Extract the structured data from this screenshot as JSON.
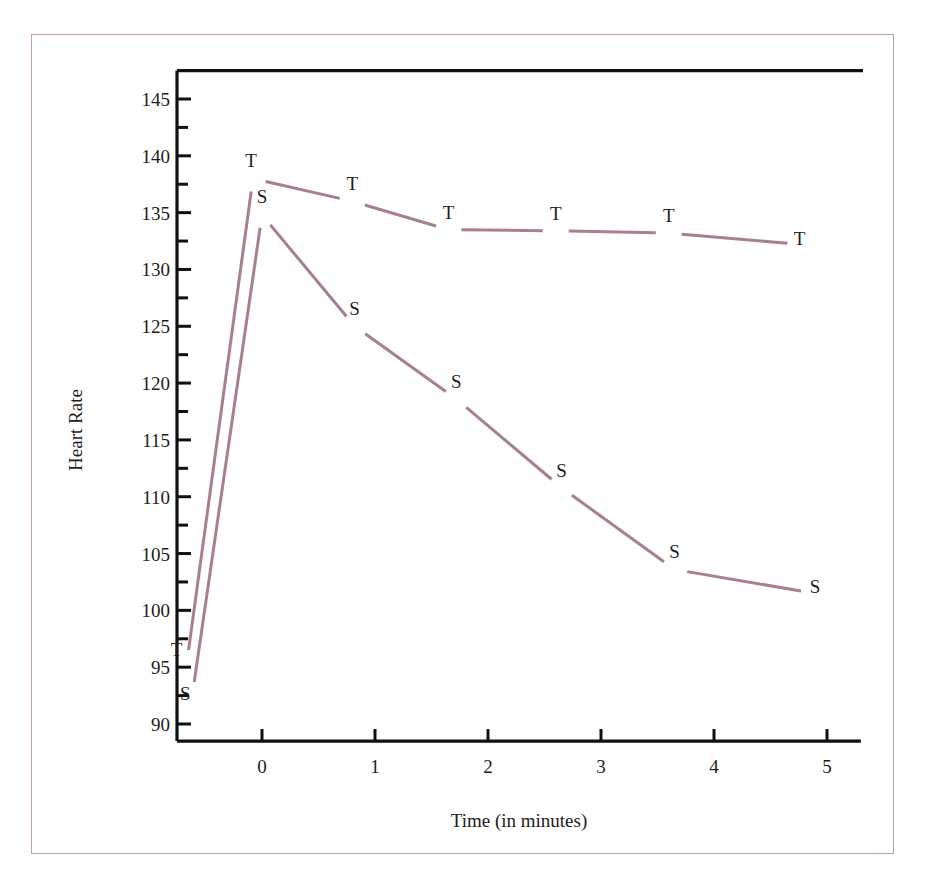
{
  "figure": {
    "frame_color": "#c0a0a8",
    "background": "#ffffff"
  },
  "chart_data": {
    "type": "line",
    "title": "",
    "subtitle": "",
    "xlabel": "Time (in minutes)",
    "ylabel": "Heart Rate",
    "xlim": [
      -0.85,
      5.3
    ],
    "ylim": [
      88.5,
      147.5
    ],
    "xticks": [
      0,
      1,
      2,
      3,
      4,
      5
    ],
    "xtick_labels": [
      "0",
      "1",
      "2",
      "3",
      "4",
      "5"
    ],
    "yticks": [
      90,
      95,
      100,
      105,
      110,
      115,
      120,
      125,
      130,
      135,
      140,
      145
    ],
    "ytick_labels": [
      "90",
      "95",
      "100",
      "105",
      "110",
      "115",
      "120",
      "125",
      "130",
      "135",
      "140",
      "145"
    ],
    "yminor_ticks": [
      92.5,
      97.5,
      102.5,
      107.5,
      112.5,
      117.5,
      122.5,
      127.5,
      132.5,
      137.5,
      142.5
    ],
    "grid": false,
    "legend": "none",
    "point_marker": "letter",
    "line_color": "#a6808c",
    "line_width": 3,
    "series": [
      {
        "name": "T",
        "label_letter": "T",
        "color": "#a6808c",
        "x": [
          -0.65,
          -0.08,
          0.8,
          1.65,
          2.6,
          3.6,
          4.65
        ],
        "values": [
          96.5,
          138.0,
          136.0,
          133.5,
          133.4,
          133.2,
          132.3
        ],
        "label_offsets": [
          {
            "dx": -12,
            "dy": 6
          },
          {
            "dx": -2,
            "dy": -12
          },
          {
            "dx": 0,
            "dy": -11
          },
          {
            "dx": 0,
            "dy": -11
          },
          {
            "dx": 0,
            "dy": -11
          },
          {
            "dx": 0,
            "dy": -11
          },
          {
            "dx": 12,
            "dy": 2
          }
        ]
      },
      {
        "name": "S",
        "label_letter": "S",
        "color": "#a6808c",
        "x": [
          -0.6,
          0.0,
          0.82,
          1.72,
          2.65,
          3.65,
          4.77
        ],
        "values": [
          93.7,
          134.8,
          125.0,
          118.6,
          110.8,
          103.6,
          101.7
        ],
        "label_offsets": [
          {
            "dx": -9,
            "dy": 18
          },
          {
            "dx": 0,
            "dy": -12
          },
          {
            "dx": 0,
            "dy": -11
          },
          {
            "dx": 0,
            "dy": -11
          },
          {
            "dx": 0,
            "dy": -11
          },
          {
            "dx": 0,
            "dy": -11
          },
          {
            "dx": 14,
            "dy": 2
          }
        ]
      }
    ]
  },
  "axes": {
    "y_axis_title": "Heart Rate",
    "x_axis_title": "Time (in minutes)"
  }
}
